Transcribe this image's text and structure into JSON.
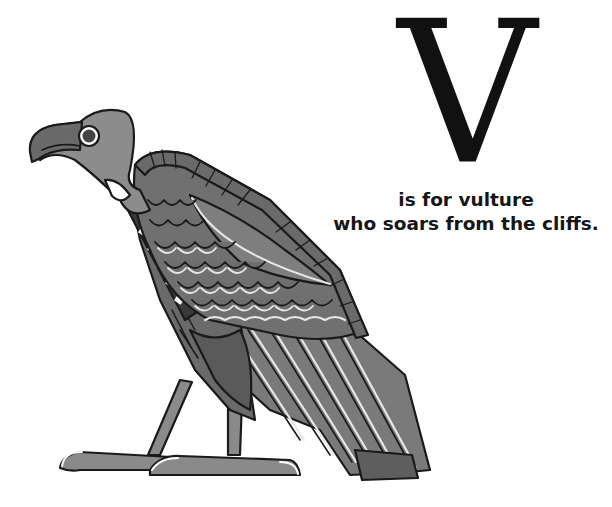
{
  "page": {
    "letter": "V",
    "caption_lines": [
      "is for vulture",
      "who soars from the cliffs."
    ]
  },
  "illustration": {
    "subject": "vulture",
    "style": "egyptian-style grayscale drawing",
    "colors": {
      "outline": "#1a1a1a",
      "head": "#8c8c8c",
      "beak": "#6a6a6a",
      "wing_dark": "#5e5e5e",
      "wing_mid": "#7d7d7d",
      "highlight": "#e6e6e6",
      "background": "#ffffff"
    }
  }
}
